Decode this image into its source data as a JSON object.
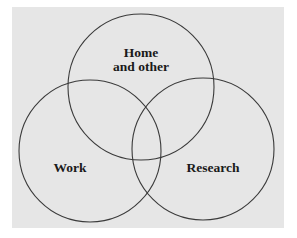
{
  "diagram": {
    "type": "venn",
    "background": {
      "x": 12,
      "y": 7,
      "width": 272,
      "height": 221,
      "color": "#e6e6e6"
    },
    "stroke_color": "#3a3a3a",
    "sets": [
      {
        "id": "home",
        "label_lines": [
          "Home",
          "and other"
        ],
        "circle": {
          "cx": 141,
          "cy": 87,
          "r": 73
        },
        "label_pos": [
          {
            "x": 141,
            "y": 57
          },
          {
            "x": 141,
            "y": 71
          }
        ]
      },
      {
        "id": "work",
        "label_lines": [
          "Work"
        ],
        "circle": {
          "cx": 90,
          "cy": 151,
          "r": 71
        },
        "label_pos": [
          {
            "x": 70,
            "y": 172
          }
        ]
      },
      {
        "id": "research",
        "label_lines": [
          "Research"
        ],
        "circle": {
          "cx": 203,
          "cy": 149,
          "r": 71
        },
        "label_pos": [
          {
            "x": 213,
            "y": 172
          }
        ]
      }
    ]
  }
}
